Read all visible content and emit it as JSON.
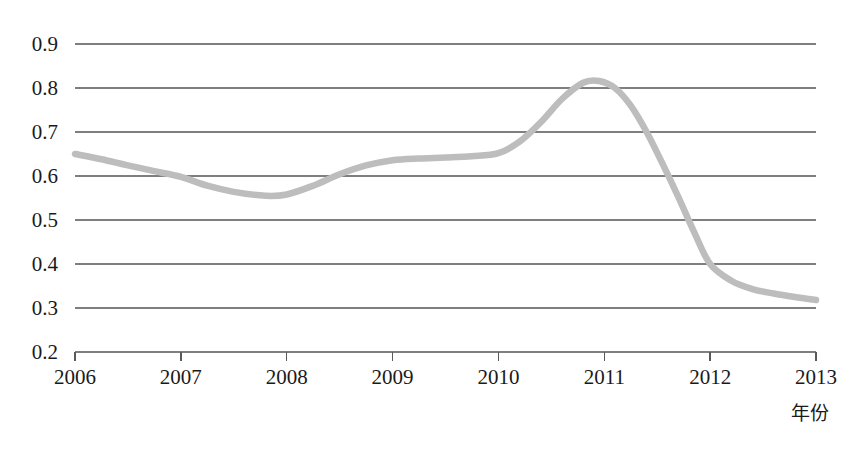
{
  "chart_data": {
    "type": "line",
    "title": "",
    "subtitle": "",
    "xlabel": "年份",
    "ylabel": "",
    "xlim": [
      2006,
      2013
    ],
    "ylim": [
      0.2,
      0.9
    ],
    "grid": true,
    "gridlines_axis": "y",
    "legend": "none",
    "line_color": "#bdbdbd",
    "axis_color": "#595959",
    "grid_color": "#7f7f7f",
    "text_color": "#1a1a1a",
    "background": "#ffffff",
    "x_ticks": [
      2006,
      2007,
      2008,
      2009,
      2010,
      2011,
      2012,
      2013
    ],
    "x_tick_labels": [
      "2006",
      "2007",
      "2008",
      "2009",
      "2010",
      "2011",
      "2012",
      "2013"
    ],
    "y_ticks": [
      0.2,
      0.3,
      0.4,
      0.5,
      0.6,
      0.7,
      0.8,
      0.9
    ],
    "y_tick_labels": [
      "0.2",
      "0.3",
      "0.4",
      "0.5",
      "0.6",
      "0.7",
      "0.8",
      "0.9"
    ],
    "series": [
      {
        "name": "series-1",
        "color": "#bdbdbd",
        "x": [
          2006.0,
          2006.25,
          2006.5,
          2006.75,
          2007.0,
          2007.25,
          2007.5,
          2007.8,
          2008.0,
          2008.25,
          2008.5,
          2008.75,
          2009.0,
          2009.25,
          2009.5,
          2009.75,
          2010.0,
          2010.2,
          2010.4,
          2010.6,
          2010.8,
          2010.95,
          2011.1,
          2011.25,
          2011.4,
          2011.55,
          2011.7,
          2011.85,
          2012.0,
          2012.2,
          2012.4,
          2012.6,
          2012.8,
          2013.0
        ],
        "values": [
          0.65,
          0.638,
          0.624,
          0.611,
          0.598,
          0.578,
          0.564,
          0.555,
          0.558,
          0.578,
          0.604,
          0.624,
          0.636,
          0.64,
          0.642,
          0.645,
          0.652,
          0.678,
          0.722,
          0.775,
          0.812,
          0.816,
          0.8,
          0.76,
          0.7,
          0.628,
          0.552,
          0.472,
          0.4,
          0.362,
          0.343,
          0.333,
          0.325,
          0.318
        ]
      }
    ],
    "annotations": []
  },
  "axis": {
    "x_label_text": "年份"
  }
}
